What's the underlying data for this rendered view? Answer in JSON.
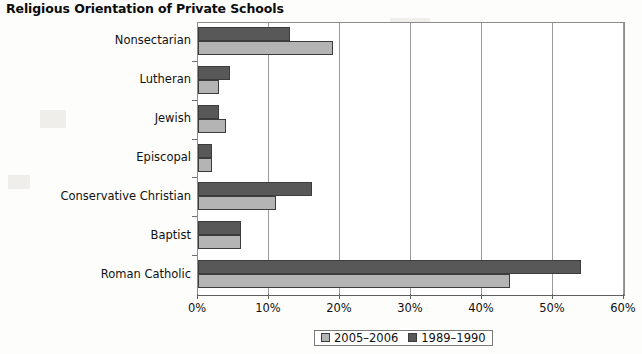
{
  "title": "Religious Orientation of Private Schools",
  "legend": {
    "position": "bottom-center",
    "entries": [
      {
        "label": "2005–2006",
        "color": "#b4b4b4",
        "icon": "legend-swatch-light"
      },
      {
        "label": "1989–1990",
        "color": "#585858",
        "icon": "legend-swatch-dark"
      }
    ]
  },
  "axis": {
    "x_ticks": [
      "0%",
      "10%",
      "20%",
      "30%",
      "40%",
      "50%",
      "60%"
    ],
    "x_min": 0,
    "x_max": 60
  },
  "chart_data": {
    "type": "bar",
    "orientation": "horizontal",
    "title": "Religious Orientation of Private Schools",
    "xlabel": "",
    "ylabel": "",
    "xlim": [
      0,
      60
    ],
    "xticks": [
      0,
      10,
      20,
      30,
      40,
      50,
      60
    ],
    "xtick_labels": [
      "0%",
      "10%",
      "20%",
      "30%",
      "40%",
      "50%",
      "60%"
    ],
    "grid": true,
    "legend_position": "bottom-center",
    "categories": [
      "Nonsectarian",
      "Lutheran",
      "Jewish",
      "Episcopal",
      "Conservative Christian",
      "Baptist",
      "Roman Catholic"
    ],
    "series": [
      {
        "name": "1989–1990",
        "color": "#585858",
        "values": [
          13,
          4.5,
          3,
          2,
          16,
          6,
          54
        ]
      },
      {
        "name": "2005–2006",
        "color": "#b4b4b4",
        "values": [
          19,
          3,
          4,
          2,
          11,
          6,
          44
        ]
      }
    ]
  }
}
